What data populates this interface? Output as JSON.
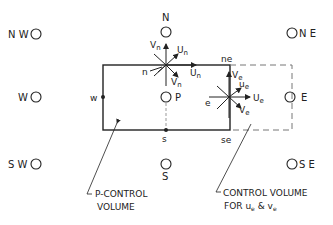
{
  "diagram": {
    "colors": {
      "ink": "#222222",
      "background": "#ffffff"
    },
    "nodes": {
      "NW": "N W",
      "N": "N",
      "NE": "N E",
      "W": "W",
      "P": "P",
      "E": "E",
      "SW": "S W",
      "S": "S",
      "SE": "S E"
    },
    "faces": {
      "n": "n",
      "w": "w",
      "s": "s",
      "ne": "ne",
      "se": "se",
      "e": "e"
    },
    "velocities_n": {
      "Vn_up": "V",
      "Vn_sub": "n",
      "Un_diag": "U",
      "Un_diag_sub": "n",
      "Un_right": "U",
      "Un_right_sub": "n",
      "Vn_diag": "V",
      "Vn_diag_sub": "n"
    },
    "velocities_e": {
      "Ve_up": "V",
      "Ve_sub": "e",
      "ue_diag": "u",
      "ue_diag_sub": "e",
      "Ue_right": "U",
      "Ue_right_sub": "e",
      "ve_diag": "V",
      "ve_diag_sub": "e"
    },
    "callouts": {
      "p_control_line1": "P-CONTROL",
      "p_control_line2": "VOLUME",
      "cv_line1": "CONTROL VOLUME",
      "cv_line2_a": "FOR u",
      "cv_line2_sub1": "e",
      "cv_line2_b": " & v",
      "cv_line2_sub2": "e"
    }
  }
}
